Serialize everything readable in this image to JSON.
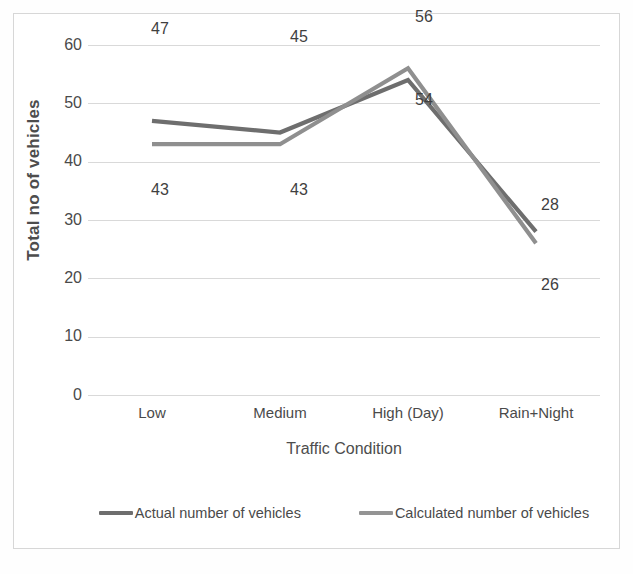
{
  "chart_data": {
    "type": "line",
    "title": "",
    "xlabel": "Traffic Condition",
    "ylabel": "Total no of vehicles",
    "categories": [
      "Low",
      "Medium",
      "High (Day)",
      "Rain+Night"
    ],
    "ylim": [
      0,
      60
    ],
    "ytick_labels": [
      "0",
      "10",
      "20",
      "30",
      "40",
      "50",
      "60"
    ],
    "yticks": [
      0,
      10,
      20,
      30,
      40,
      50,
      60
    ],
    "grid": "horizontal",
    "legend_position": "bottom",
    "series": [
      {
        "name": "Actual number of vehicles",
        "color": "#6e6e6e",
        "values": [
          47,
          45,
          54,
          28
        ],
        "labels": [
          "47",
          "45",
          "54",
          "28"
        ]
      },
      {
        "name": "Calculated number of vehicles",
        "color": "#8f8f8f",
        "values": [
          43,
          43,
          56,
          26
        ],
        "labels": [
          "43",
          "43",
          "56",
          "26"
        ]
      }
    ],
    "annotations": [
      {
        "text": "47",
        "series": 0,
        "index": 0,
        "placement": "above"
      },
      {
        "text": "45",
        "series": 0,
        "index": 1,
        "placement": "above"
      },
      {
        "text": "54",
        "series": 0,
        "index": 2,
        "placement": "below"
      },
      {
        "text": "28",
        "series": 0,
        "index": 3,
        "placement": "above-right"
      },
      {
        "text": "43",
        "series": 1,
        "index": 0,
        "placement": "below"
      },
      {
        "text": "43",
        "series": 1,
        "index": 1,
        "placement": "below"
      },
      {
        "text": "56",
        "series": 1,
        "index": 2,
        "placement": "above"
      },
      {
        "text": "26",
        "series": 1,
        "index": 3,
        "placement": "below-right"
      }
    ]
  },
  "axes": {
    "y_title": "Total no of vehicles",
    "x_title": "Traffic Condition",
    "y_tick_0": "0",
    "y_tick_1": "10",
    "y_tick_2": "20",
    "y_tick_3": "30",
    "y_tick_4": "40",
    "y_tick_5": "50",
    "y_tick_6": "60",
    "x_tick_0": "Low",
    "x_tick_1": "Medium",
    "x_tick_2": "High (Day)",
    "x_tick_3": "Rain+Night"
  },
  "legend": {
    "entry_0": "Actual number of vehicles",
    "entry_1": "Calculated number of vehicles"
  },
  "labels": {
    "low_actual": "47",
    "low_calculated": "43",
    "medium_actual": "45",
    "medium_calculated": "43",
    "high_actual": "54",
    "high_calculated": "56",
    "rain_actual": "28",
    "rain_calculated": "26"
  },
  "colors": {
    "series_actual": "#6e6e6e",
    "series_calculated": "#8f8f8f",
    "gridline": "#d9d9d9",
    "frame": "#d7d7d7",
    "text": "#4a4a4a"
  }
}
